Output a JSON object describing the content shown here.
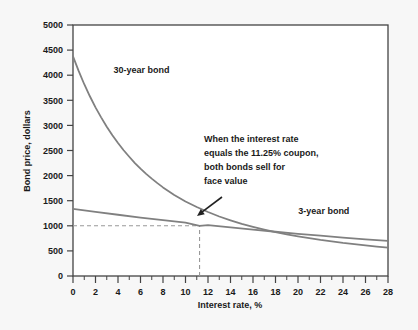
{
  "chart_data": {
    "type": "line",
    "title": "",
    "xlabel": "Interest rate, %",
    "ylabel": "Bond price, dollars",
    "xlim": [
      0,
      28
    ],
    "ylim": [
      0,
      5000
    ],
    "x_ticks": [
      0,
      2,
      4,
      6,
      8,
      10,
      12,
      14,
      16,
      18,
      20,
      22,
      24,
      26,
      28
    ],
    "x_tick_labels": [
      "0",
      "2",
      "4",
      "6",
      "8",
      "10",
      "12",
      "14",
      "16",
      "18",
      "20",
      "22",
      "24",
      "26",
      "28"
    ],
    "x_minor_ticks": [
      1,
      3,
      5,
      7,
      9,
      11,
      13,
      15,
      17,
      19,
      21,
      23,
      25,
      27
    ],
    "y_ticks": [
      0,
      500,
      1000,
      1500,
      2000,
      2500,
      3000,
      3500,
      4000,
      4500,
      5000
    ],
    "y_tick_labels": [
      "0",
      "500",
      "1000",
      "1500",
      "2000",
      "2500",
      "3000",
      "3500",
      "4000",
      "4500",
      "5000"
    ],
    "grid": false,
    "legend": "inline-labels",
    "series": [
      {
        "name": "30-year bond",
        "color": "#808080",
        "label_x": 3.6,
        "label_y": 4050,
        "x": [
          0,
          0.5,
          1,
          1.5,
          2,
          2.5,
          3,
          3.5,
          4,
          4.5,
          5,
          5.5,
          6,
          6.5,
          7,
          7.5,
          8,
          8.5,
          9,
          9.5,
          10,
          10.5,
          11,
          11.25,
          11.5,
          12,
          12.5,
          13,
          14,
          15,
          16,
          17,
          18,
          19,
          20,
          21,
          22,
          23,
          24,
          25,
          26,
          27,
          28
        ],
        "y": [
          4375,
          4085,
          3820,
          3580,
          3360,
          3160,
          2975,
          2805,
          2650,
          2505,
          2375,
          2250,
          2140,
          2035,
          1940,
          1850,
          1765,
          1690,
          1615,
          1550,
          1485,
          1430,
          1375,
          1350,
          1325,
          1275,
          1230,
          1185,
          1110,
          1040,
          980,
          925,
          875,
          830,
          790,
          755,
          720,
          690,
          660,
          635,
          610,
          585,
          565
        ]
      },
      {
        "name": "3-year bond",
        "color": "#808080",
        "label_x": 22.3,
        "label_y": 1230,
        "x": [
          0,
          2,
          4,
          6,
          8,
          10,
          11.25,
          12,
          14,
          16,
          18,
          20,
          22,
          24,
          26,
          28
        ],
        "y": [
          1337,
          1277,
          1220,
          1165,
          1112,
          1062,
          1000,
          1013,
          967,
          923,
          881,
          841,
          803,
          766,
          731,
          698
        ]
      }
    ],
    "intersection": {
      "x": 11.25,
      "y": 1000
    },
    "guide_lines": [
      {
        "type": "horizontal",
        "y": 1000,
        "from_x": 0,
        "to_x": 11.25,
        "style": "dashed"
      },
      {
        "type": "vertical",
        "x": 11.25,
        "from_y": 0,
        "to_y": 1000,
        "style": "dashed"
      }
    ],
    "annotation": {
      "lines": [
        "When the interest rate",
        "equals the 11.25% coupon,",
        "both bonds sell for",
        "face value"
      ],
      "arrow_from": {
        "x": 222,
        "y": 197
      },
      "arrow_to": {
        "x": 197,
        "y": 216
      }
    },
    "colors": {
      "background": "#f7f7f7",
      "plot_background": "#ffffff",
      "axis": "#444444",
      "curve": "#808080",
      "text": "#1a1a1a",
      "guide": "#999999"
    }
  }
}
